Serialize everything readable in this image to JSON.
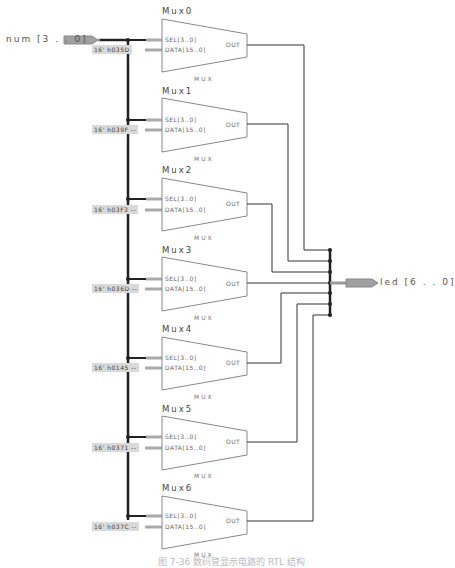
{
  "input_port": {
    "label": "num [3 . . 0]"
  },
  "output_port": {
    "label": "led [6 . . 0]"
  },
  "muxes": [
    {
      "name": "Mux0",
      "constant": "16' h035D",
      "sel_pin": "SEL[3..0]",
      "data_pin": "DATA[15..0]",
      "out_pin": "OUT",
      "type": "MUX"
    },
    {
      "name": "Mux1",
      "constant": "16' h039F --",
      "sel_pin": "SEL[3..0]",
      "data_pin": "DATA[15..0]",
      "out_pin": "OUT",
      "type": "MUX"
    },
    {
      "name": "Mux2",
      "constant": "16' h03F3 --",
      "sel_pin": "SEL[3..0]",
      "data_pin": "DATA[15..0]",
      "out_pin": "OUT",
      "type": "MUX"
    },
    {
      "name": "Mux3",
      "constant": "16' h036D --",
      "sel_pin": "SEL[3..0]",
      "data_pin": "DATA[15..0]",
      "out_pin": "OUT",
      "type": "MUX"
    },
    {
      "name": "Mux4",
      "constant": "16' h0145 --",
      "sel_pin": "SEL[3..0]",
      "data_pin": "DATA[15..0]",
      "out_pin": "OUT",
      "type": "MUX"
    },
    {
      "name": "Mux5",
      "constant": "16' h0371 --",
      "sel_pin": "SEL[3..0]",
      "data_pin": "DATA[15..0]",
      "out_pin": "OUT",
      "type": "MUX"
    },
    {
      "name": "Mux6",
      "constant": "16' h037C --",
      "sel_pin": "SEL[3..0]",
      "data_pin": "DATA[15..0]",
      "out_pin": "OUT",
      "type": "MUX"
    }
  ],
  "colors": {
    "wire": "#222222",
    "bus": "#333333",
    "mux_outline": "#888888",
    "port_fill": "#999999",
    "const_fill": "#d9d9d9"
  },
  "caption": "图 7-36 数码管显示电路的 RTL 结构"
}
